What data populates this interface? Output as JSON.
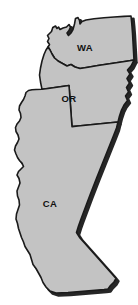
{
  "figure": {
    "kind": "region-map",
    "width": 138,
    "height": 305,
    "background_color": "#ffffff"
  },
  "style": {
    "land_fill": "#c3c3c3",
    "outline_color": "#1a1a1a",
    "shadow_color": "#141414",
    "label_color": "#111111",
    "outline_width": 1.6,
    "shadow_width": 3.2
  },
  "states": [
    {
      "code": "WA",
      "label": "WA",
      "label_x": 85,
      "label_y": 48
    },
    {
      "code": "OR",
      "label": "OR",
      "label_x": 69,
      "label_y": 99
    },
    {
      "code": "CA",
      "label": "CA",
      "label_x": 50,
      "label_y": 204
    }
  ],
  "geometry": {
    "washington": "M 51.5 31.5 L 52.8 27.5 L 55.5 26.0 L 57.0 28.5 L 58.5 27.0 L 60.0 29.5 L 63.0 28.0 L 66.5 27.0 L 69.0 24.5 L 70.5 27.0 L 69.0 30.5 L 67.0 33.0 L 68.5 35.5 L 71.0 33.0 L 73.0 29.5 L 74.5 24.0 L 75.5 18.5 L 78.0 17.5 L 79.5 20.5 L 80.0 24.0 L 82.0 21.5 L 86.0 20.0 L 94.0 18.8 L 104.0 17.8 L 114.0 17.0 L 124.0 16.4 L 131.0 16.0 L 131.8 24.0 L 132.5 33.0 L 133.0 42.0 L 133.5 51.0 L 134.0 60.0 L 128.0 61.0 L 118.0 62.5 L 108.0 64.0 L 98.0 65.5 L 88.0 67.2 L 80.0 68.5 L 75.0 67.0 L 71.0 64.5 L 67.0 66.0 L 62.5 63.5 L 58.0 61.0 L 54.5 58.0 L 52.0 54.0 L 50.0 50.0 L 48.0 47.0 L 49.5 44.5 L 47.5 41.5 L 49.0 38.5 L 47.5 35.5 L 49.5 33.5 Z",
    "oregon": "M 48.0 47.0 L 50.0 50.0 L 52.0 54.0 L 54.5 58.0 L 58.0 61.0 L 62.5 63.5 L 67.0 66.0 L 71.0 64.5 L 75.0 67.0 L 80.0 68.5 L 88.0 67.2 L 98.0 65.5 L 108.0 64.0 L 118.0 62.5 L 128.0 61.0 L 134.0 60.0 L 131.0 66.0 L 127.5 70.0 L 130.0 74.0 L 127.0 78.5 L 129.5 83.0 L 126.5 87.5 L 128.5 92.0 L 125.5 96.0 L 127.5 100.5 L 124.0 105.0 L 121.5 110.0 L 119.5 116.0 L 118.0 122.0 L 108.0 123.0 L 98.0 124.0 L 88.0 125.0 L 78.0 126.0 L 72.0 126.6 L 71.5 120.0 L 71.0 113.0 L 70.5 106.0 L 70.0 99.0 L 69.5 92.0 L 69.0 85.5 L 62.0 86.5 L 55.0 87.5 L 48.0 88.5 L 42.0 89.3 L 40.5 82.0 L 39.5 75.0 L 40.5 68.0 L 42.0 61.0 L 44.0 54.5 L 46.0 50.0 Z",
    "california": "M 42.0 89.3 L 48.0 88.5 L 55.0 87.5 L 62.0 86.5 L 69.0 85.5 L 69.5 92.0 L 70.0 99.0 L 70.5 106.0 L 71.0 113.0 L 71.5 120.0 L 72.0 126.6 L 78.0 126.0 L 88.0 125.0 L 98.0 124.0 L 108.0 123.0 L 118.0 122.0 L 116.5 128.0 L 113.0 137.0 L 109.0 147.0 L 105.0 157.0 L 101.0 167.0 L 97.0 177.0 L 93.5 186.0 L 90.0 195.0 L 87.0 203.0 L 84.0 211.0 L 81.0 219.0 L 78.5 226.0 L 76.5 232.5 L 80.0 238.0 L 84.5 243.0 L 88.5 247.5 L 92.5 252.0 L 96.5 256.5 L 100.5 261.0 L 104.5 265.5 L 108.5 270.0 L 112.5 274.5 L 116.0 278.5 L 114.0 282.0 L 110.5 285.5 L 108.0 289.0 L 104.0 289.5 L 98.0 290.0 L 92.0 290.5 L 86.0 291.0 L 80.0 291.5 L 74.0 292.0 L 68.0 292.5 L 62.0 292.8 L 56.0 293.0 L 50.0 291.0 L 46.0 287.0 L 43.0 282.5 L 41.0 277.5 L 38.5 273.0 L 36.0 268.5 L 33.0 264.5 L 31.5 259.5 L 30.0 254.5 L 27.5 250.5 L 25.0 246.5 L 23.5 242.0 L 21.5 237.5 L 20.0 233.0 L 18.5 228.5 L 17.5 223.5 L 16.0 219.0 L 16.5 214.0 L 18.0 209.5 L 19.5 205.0 L 19.0 200.0 L 17.5 196.0 L 17.0 191.0 L 18.5 187.0 L 20.0 183.0 L 19.0 178.5 L 17.0 175.0 L 18.5 171.5 L 21.0 169.0 L 23.5 166.5 L 22.0 163.0 L 19.5 160.5 L 17.5 157.5 L 16.0 154.0 L 14.5 150.0 L 15.5 146.0 L 17.5 142.5 L 19.0 139.0 L 18.0 135.0 L 16.0 131.5 L 15.5 127.5 L 17.0 124.0 L 19.5 121.0 L 21.0 117.5 L 20.5 113.5 L 19.0 110.0 L 19.5 106.0 L 21.5 102.5 L 23.5 99.5 L 25.0 96.0 L 26.0 92.5 L 28.5 90.5 L 32.0 89.8 L 36.0 89.5 Z"
  }
}
